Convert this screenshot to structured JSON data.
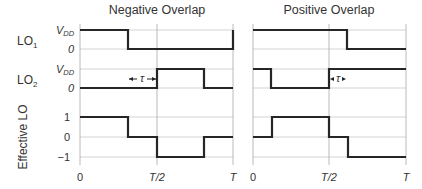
{
  "panels": [
    {
      "title": "Negative Overlap",
      "x0": 80,
      "xhalf": 157,
      "xT": 233
    },
    {
      "title": "Positive Overlap",
      "x0": 253,
      "xhalf": 329,
      "xT": 406
    }
  ],
  "rows": {
    "lo1": {
      "label": "LO",
      "sub": "1",
      "high_label": "V",
      "high_sub": "DD",
      "low_label": "0",
      "y_high": 30,
      "y_low": 49
    },
    "lo2": {
      "label": "LO",
      "sub": "2",
      "high_label": "V",
      "high_sub": "DD",
      "low_label": "0",
      "y_high": 69,
      "y_low": 88
    },
    "eff": {
      "label": "Effective LO",
      "levels": [
        "1",
        "0",
        "−1"
      ],
      "y": [
        117,
        137,
        157
      ]
    }
  },
  "x_ticks": {
    "left": [
      "0",
      "T/2",
      "T"
    ],
    "right": [
      "0",
      "T/2",
      "T"
    ]
  },
  "tau": {
    "symbol": "τ"
  },
  "waves": {
    "neg_lo1": "M80,30 L128,30 L128,49 L233,49 L233,30",
    "neg_lo2": "M80,88 L157,88 L157,69 L204,69 L204,88 L233,88",
    "neg_eff": "M80,117 L128,117 L128,137 L157,137 L157,157 L204,157 L204,137 L233,137",
    "pos_lo1": "M253,30 L347,30 L347,49 L406,49",
    "pos_lo2": "M253,69 L271,69 L271,88 L329,88 L329,69 L406,69",
    "pos_eff": "M253,137 L272,137 L272,117 L329,117 L329,137 L348,137 L348,157 L406,157"
  }
}
